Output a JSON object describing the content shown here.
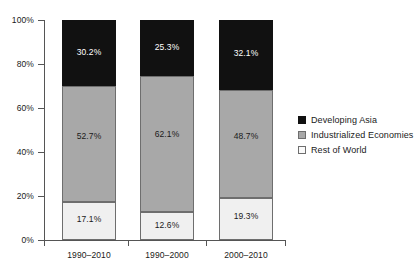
{
  "chart_data": {
    "type": "bar",
    "subtype": "stacked-100-percent",
    "title": "",
    "xlabel": "",
    "ylabel": "",
    "ylim": [
      0,
      100
    ],
    "ytick_labels": [
      "0%",
      "20%",
      "40%",
      "60%",
      "80%",
      "100%"
    ],
    "ytick_values": [
      0,
      20,
      40,
      60,
      80,
      100
    ],
    "grid": false,
    "legend_position": "right",
    "categories": [
      "1990–2010",
      "1990–2000",
      "2000–2010"
    ],
    "series": [
      {
        "name": "Developing Asia",
        "color": "#111111",
        "values": [
          30.2,
          25.3,
          32.1
        ],
        "labels": [
          "30.2%",
          "25.3%",
          "32.1%"
        ]
      },
      {
        "name": "Industrialized Economies",
        "color": "#a8a8a8",
        "values": [
          52.7,
          62.1,
          48.7
        ],
        "labels": [
          "52.7%",
          "62.1%",
          "48.7%"
        ]
      },
      {
        "name": "Rest of World",
        "color": "#f0f0f0",
        "values": [
          17.1,
          12.6,
          19.3
        ],
        "labels": [
          "17.1%",
          "12.6%",
          "19.3%"
        ]
      }
    ],
    "stack_order_bottom_to_top": [
      "Rest of World",
      "Industrialized Economies",
      "Developing Asia"
    ]
  },
  "axis": {
    "y": {
      "ticks": [
        {
          "label": "100%",
          "value": 100
        },
        {
          "label": "80%",
          "value": 80
        },
        {
          "label": "60%",
          "value": 60
        },
        {
          "label": "40%",
          "value": 40
        },
        {
          "label": "20%",
          "value": 20
        },
        {
          "label": "0%",
          "value": 0
        }
      ]
    },
    "x": {
      "ticks": [
        {
          "label": "1990–2010"
        },
        {
          "label": "1990–2000"
        },
        {
          "label": "2000–2010"
        }
      ]
    }
  },
  "legend": {
    "items": [
      {
        "label": "Developing Asia",
        "swatch": "dark"
      },
      {
        "label": "Industrialized Economies",
        "swatch": "mid"
      },
      {
        "label": "Rest of World",
        "swatch": "light"
      }
    ]
  },
  "bars": [
    {
      "category": "1990–2010",
      "segments": [
        {
          "series": "Developing Asia",
          "label": "30.2%",
          "value": 30.2
        },
        {
          "series": "Industrialized Economies",
          "label": "52.7%",
          "value": 52.7
        },
        {
          "series": "Rest of World",
          "label": "17.1%",
          "value": 17.1
        }
      ]
    },
    {
      "category": "1990–2000",
      "segments": [
        {
          "series": "Developing Asia",
          "label": "25.3%",
          "value": 25.3
        },
        {
          "series": "Industrialized Economies",
          "label": "62.1%",
          "value": 62.1
        },
        {
          "series": "Rest of World",
          "label": "12.6%",
          "value": 12.6
        }
      ]
    },
    {
      "category": "2000–2010",
      "segments": [
        {
          "series": "Developing Asia",
          "label": "32.1%",
          "value": 32.1
        },
        {
          "series": "Industrialized Economies",
          "label": "48.7%",
          "value": 48.7
        },
        {
          "series": "Rest of World",
          "label": "19.3%",
          "value": 19.3
        }
      ]
    }
  ]
}
